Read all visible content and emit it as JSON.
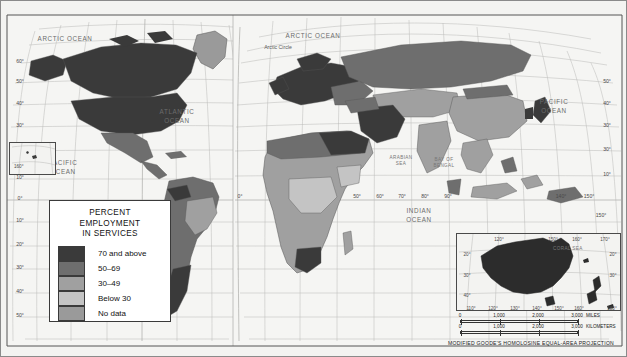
{
  "map": {
    "title": "World map of percent employment in services",
    "projection_caption": "MODIFIED GOODE'S HOMOLOSINE EQUAL-AREA PROJECTION"
  },
  "legend": {
    "title_line1": "PERCENT",
    "title_line2": "EMPLOYMENT",
    "title_line3": "IN SERVICES",
    "entries": [
      {
        "label": "70 and above",
        "color": "#3a3a3a"
      },
      {
        "label": "50–69",
        "color": "#6e6e6e"
      },
      {
        "label": "30–49",
        "color": "#a0a0a0"
      },
      {
        "label": "Below 30",
        "color": "#c4c4c4"
      },
      {
        "label": "No data",
        "color": "#9a9a9a"
      }
    ]
  },
  "ocean_labels": [
    {
      "id": "arctic-ocean-west",
      "line1": "ARCTIC OCEAN",
      "line2": "",
      "x": 64,
      "y": 40
    },
    {
      "id": "arctic-ocean-east",
      "line1": "ARCTIC OCEAN",
      "line2": "",
      "x": 312,
      "y": 37
    },
    {
      "id": "atlantic-ocean",
      "line1": "ATLANTIC",
      "line2": "OCEAN",
      "x": 176,
      "y": 113
    },
    {
      "id": "pacific-ocean-west",
      "line1": "PACIFIC",
      "line2": "OCEAN",
      "x": 62,
      "y": 164
    },
    {
      "id": "pacific-ocean-east",
      "line1": "PACIFIC",
      "line2": "OCEAN",
      "x": 553,
      "y": 103
    },
    {
      "id": "indian-ocean",
      "line1": "INDIAN",
      "line2": "OCEAN",
      "x": 418,
      "y": 212
    }
  ],
  "sea_labels": [
    {
      "id": "arabian-sea",
      "line1": "ARABIAN",
      "line2": "SEA",
      "x": 400,
      "y": 158
    },
    {
      "id": "bay-of-bengal",
      "line1": "BAY OF",
      "line2": "BENGAL",
      "x": 443,
      "y": 160
    }
  ],
  "annotations": [
    {
      "id": "arctic-circle",
      "label": "Arctic Circle",
      "x": 277,
      "y": 48
    }
  ],
  "latitude_ticks_left": [
    {
      "label": "60°",
      "y": 62
    },
    {
      "label": "50°",
      "y": 82
    },
    {
      "label": "40°",
      "y": 104
    },
    {
      "label": "30°",
      "y": 126
    },
    {
      "label": "10°",
      "y": 178
    },
    {
      "label": "0°",
      "y": 199
    },
    {
      "label": "10°",
      "y": 221
    },
    {
      "label": "20°",
      "y": 245
    },
    {
      "label": "30°",
      "y": 268
    },
    {
      "label": "40°",
      "y": 292
    },
    {
      "label": "50°",
      "y": 316
    }
  ],
  "latitude_ticks_right": [
    {
      "label": "50°",
      "y": 82
    },
    {
      "label": "40°",
      "y": 104
    },
    {
      "label": "30°",
      "y": 126
    },
    {
      "label": "30°",
      "y": 150
    },
    {
      "label": "10°",
      "y": 175
    }
  ],
  "longitude_ticks": [
    {
      "label": "0°",
      "x": 239,
      "y": 197
    },
    {
      "label": "50°",
      "x": 356,
      "y": 197
    },
    {
      "label": "60°",
      "x": 379,
      "y": 197
    },
    {
      "label": "70°",
      "x": 401,
      "y": 197
    },
    {
      "label": "80°",
      "x": 424,
      "y": 197
    },
    {
      "label": "90°",
      "x": 447,
      "y": 197
    },
    {
      "label": "140°",
      "x": 560,
      "y": 197
    },
    {
      "label": "150°",
      "x": 588,
      "y": 197
    },
    {
      "label": "160°",
      "x": 21,
      "y": 168
    },
    {
      "label": "150°",
      "x": 600,
      "y": 216
    }
  ],
  "inset_australia": {
    "sea_label": "CORAL SEA",
    "top_ticks": [
      "120°",
      "150°",
      "160°",
      "170°"
    ],
    "left_ticks": [
      "20°",
      "30°",
      "40°"
    ],
    "right_ticks": [
      "20°",
      "30°"
    ],
    "bottom_ticks": [
      "110°",
      "120°",
      "130°",
      "140°",
      "150°",
      "160°",
      "180°"
    ]
  },
  "inset_pacific": {
    "tick": "160°"
  },
  "scale": {
    "miles": {
      "ticks": [
        "0",
        "1,000",
        "2,000",
        "3,000"
      ],
      "unit": "MILES"
    },
    "kilometers": {
      "ticks": [
        "0",
        "1,000",
        "2,000",
        "3,000"
      ],
      "unit": "KILOMETERS"
    }
  },
  "chart_data": {
    "type": "map",
    "title": "Percent Employment in Services",
    "variable": "Percent of employment in the services sector",
    "classes": [
      "70 and above",
      "50–69",
      "30–49",
      "Below 30",
      "No data"
    ],
    "class_colors": [
      "#3a3a3a",
      "#6e6e6e",
      "#a0a0a0",
      "#c4c4c4",
      "#9a9a9a"
    ],
    "projection": "Modified Goode's Homolosine Equal-Area",
    "regions": [
      {
        "name": "Canada",
        "class": "70 and above"
      },
      {
        "name": "United States",
        "class": "70 and above"
      },
      {
        "name": "Greenland",
        "class": "No data"
      },
      {
        "name": "Mexico",
        "class": "50–69"
      },
      {
        "name": "Brazil",
        "class": "50–69"
      },
      {
        "name": "Argentina",
        "class": "70 and above"
      },
      {
        "name": "Chile",
        "class": "50–69"
      },
      {
        "name": "Peru",
        "class": "50–69"
      },
      {
        "name": "Bolivia",
        "class": "30–49"
      },
      {
        "name": "Colombia",
        "class": "50–69"
      },
      {
        "name": "Venezuela",
        "class": "70 and above"
      },
      {
        "name": "United Kingdom",
        "class": "70 and above"
      },
      {
        "name": "France",
        "class": "70 and above"
      },
      {
        "name": "Germany",
        "class": "70 and above"
      },
      {
        "name": "Spain",
        "class": "70 and above"
      },
      {
        "name": "Italy",
        "class": "70 and above"
      },
      {
        "name": "Poland",
        "class": "50–69"
      },
      {
        "name": "Russia",
        "class": "50–69"
      },
      {
        "name": "Ukraine",
        "class": "50–69"
      },
      {
        "name": "Turkey",
        "class": "50–69"
      },
      {
        "name": "Saudi Arabia",
        "class": "70 and above"
      },
      {
        "name": "Egypt",
        "class": "50–69"
      },
      {
        "name": "Algeria",
        "class": "50–69"
      },
      {
        "name": "Libya",
        "class": "70 and above"
      },
      {
        "name": "Nigeria",
        "class": "30–49"
      },
      {
        "name": "Ethiopia",
        "class": "Below 30"
      },
      {
        "name": "Democratic Republic of the Congo",
        "class": "Below 30"
      },
      {
        "name": "South Africa",
        "class": "70 and above"
      },
      {
        "name": "India",
        "class": "30–49"
      },
      {
        "name": "China",
        "class": "30–49"
      },
      {
        "name": "Mongolia",
        "class": "50–69"
      },
      {
        "name": "Japan",
        "class": "70 and above"
      },
      {
        "name": "Indonesia",
        "class": "30–49"
      },
      {
        "name": "Australia",
        "class": "70 and above"
      },
      {
        "name": "New Zealand",
        "class": "70 and above"
      }
    ]
  }
}
